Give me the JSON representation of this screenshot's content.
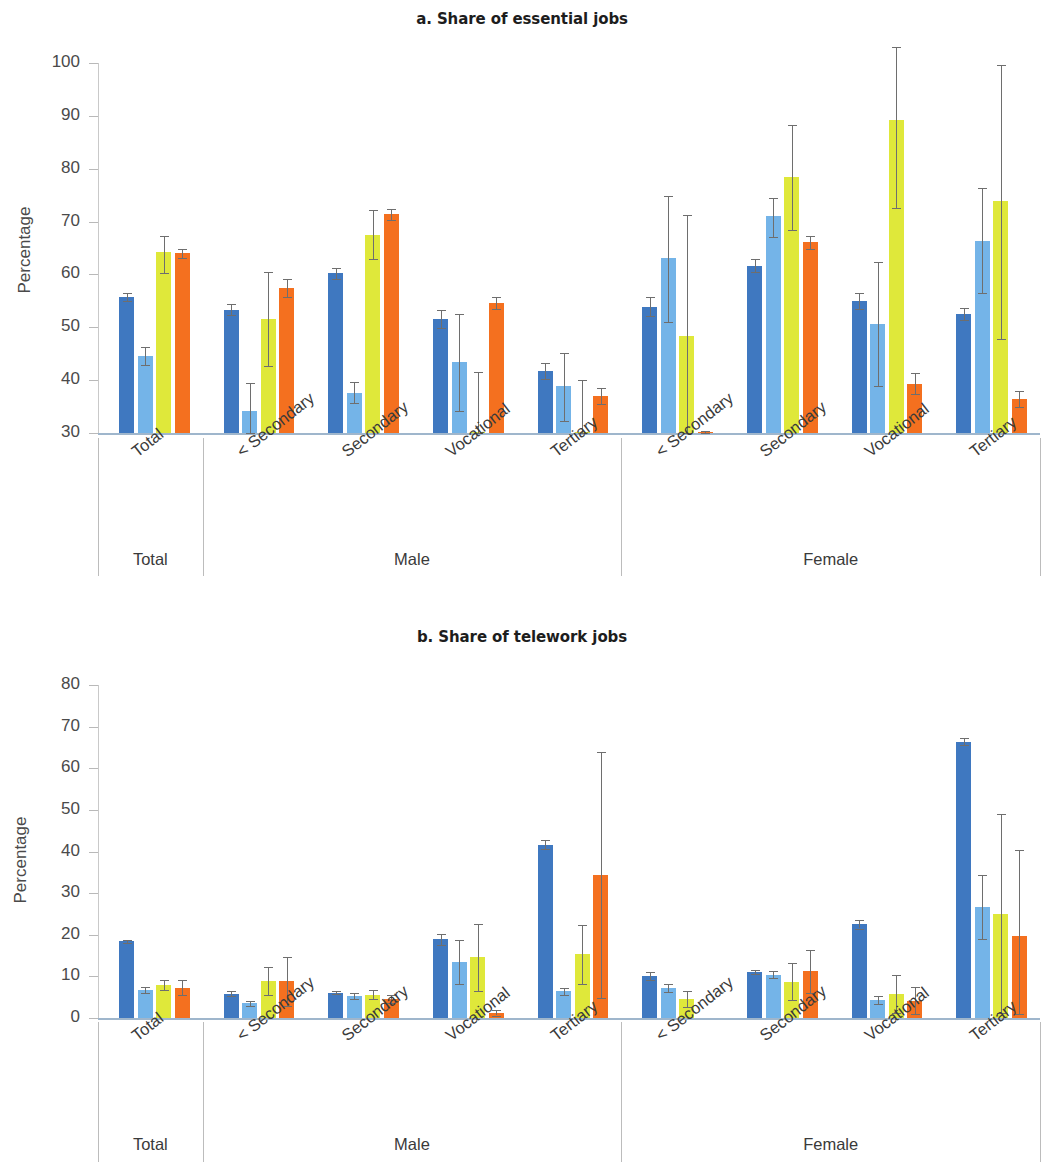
{
  "figure": {
    "y_axis_label": "Percentage"
  },
  "chart_data": [
    {
      "type": "bar",
      "panel": "a",
      "title": "a. Share of essential jobs",
      "xlabel": "",
      "ylabel": "Percentage",
      "ylim": [
        30,
        100
      ],
      "yticks": [
        30,
        40,
        50,
        60,
        70,
        80,
        90,
        100
      ],
      "grid": false,
      "legend": "none",
      "series": [
        {
          "name": "series-1",
          "color": "#3f78c0"
        },
        {
          "name": "series-2",
          "color": "#74b4e8"
        },
        {
          "name": "series-3",
          "color": "#dfe83a"
        },
        {
          "name": "series-4",
          "color": "#f4701f"
        }
      ],
      "supergroups": [
        {
          "label": "Total",
          "categories": [
            "Total"
          ]
        },
        {
          "label": "Male",
          "categories": [
            "< Secondary",
            "Secondary",
            "Vocational",
            "Tertiary"
          ]
        },
        {
          "label": "Female",
          "categories": [
            "< Secondary",
            "Secondary",
            "Vocational",
            "Tertiary"
          ]
        }
      ],
      "categories": [
        "Total",
        "< Secondary",
        "Secondary",
        "Vocational",
        "Tertiary",
        "< Secondary",
        "Secondary",
        "Vocational",
        "Tertiary"
      ],
      "groups": [
        {
          "supergroup": "Total",
          "category": "Total",
          "values": [
            55.8,
            44.6,
            64.2,
            64.0
          ],
          "err_low": [
            55.0,
            42.9,
            60.3,
            63.2
          ],
          "err_high": [
            56.5,
            46.2,
            67.3,
            64.8
          ]
        },
        {
          "supergroup": "Male",
          "category": "< Secondary",
          "values": [
            53.3,
            34.1,
            51.6,
            57.5
          ],
          "err_low": [
            52.3,
            29.3,
            42.6,
            55.8
          ],
          "err_high": [
            54.4,
            39.4,
            60.4,
            59.2
          ]
        },
        {
          "supergroup": "Male",
          "category": "Secondary",
          "values": [
            60.2,
            37.6,
            67.5,
            71.4
          ],
          "err_low": [
            59.2,
            35.7,
            62.9,
            70.3
          ],
          "err_high": [
            61.2,
            39.6,
            72.1,
            72.3
          ]
        },
        {
          "supergroup": "Male",
          "category": "Vocational",
          "values": [
            51.6,
            43.4,
            30.1,
            54.6
          ],
          "err_low": [
            49.8,
            34.1,
            30.0,
            53.5
          ],
          "err_high": [
            53.3,
            52.6,
            41.6,
            55.8
          ]
        },
        {
          "supergroup": "Male",
          "category": "Tertiary",
          "values": [
            41.7,
            38.9,
            30.1,
            37.0
          ],
          "err_low": [
            40.3,
            32.2,
            30.0,
            35.5
          ],
          "err_high": [
            43.2,
            45.2,
            40.0,
            38.6
          ]
        },
        {
          "supergroup": "Female",
          "category": "< Secondary",
          "values": [
            53.9,
            63.1,
            48.4,
            30.2
          ],
          "err_low": [
            52.2,
            51.0,
            30.0,
            30.0
          ],
          "err_high": [
            55.7,
            74.9,
            71.2,
            30.4
          ]
        },
        {
          "supergroup": "Female",
          "category": "Secondary",
          "values": [
            61.6,
            71.0,
            78.4,
            66.1
          ],
          "err_low": [
            60.4,
            67.1,
            68.4,
            64.9
          ],
          "err_high": [
            62.9,
            74.5,
            88.2,
            67.2
          ]
        },
        {
          "supergroup": "Female",
          "category": "Vocational",
          "values": [
            55.0,
            50.6,
            89.2,
            39.3
          ],
          "err_low": [
            53.5,
            38.9,
            72.5,
            37.3
          ],
          "err_high": [
            56.5,
            62.4,
            103.0,
            41.4
          ]
        },
        {
          "supergroup": "Female",
          "category": "Tertiary",
          "values": [
            52.5,
            66.4,
            73.8,
            36.4
          ],
          "err_low": [
            51.4,
            56.5,
            47.8,
            34.9
          ],
          "err_high": [
            53.7,
            76.3,
            99.7,
            38.0
          ]
        }
      ]
    },
    {
      "type": "bar",
      "panel": "b",
      "title": "b. Share of telework jobs",
      "xlabel": "",
      "ylabel": "Percentage",
      "ylim": [
        0,
        80
      ],
      "yticks": [
        0,
        10,
        20,
        30,
        40,
        50,
        60,
        70,
        80
      ],
      "grid": false,
      "legend": "none",
      "series": [
        {
          "name": "series-1",
          "color": "#3f78c0"
        },
        {
          "name": "series-2",
          "color": "#74b4e8"
        },
        {
          "name": "series-3",
          "color": "#dfe83a"
        },
        {
          "name": "series-4",
          "color": "#f4701f"
        }
      ],
      "supergroups": [
        {
          "label": "Total",
          "categories": [
            "Total"
          ]
        },
        {
          "label": "Male",
          "categories": [
            "< Secondary",
            "Secondary",
            "Vocational",
            "Tertiary"
          ]
        },
        {
          "label": "Female",
          "categories": [
            "< Secondary",
            "Secondary",
            "Vocational",
            "Tertiary"
          ]
        }
      ],
      "categories": [
        "Total",
        "< Secondary",
        "Secondary",
        "Vocational",
        "Tertiary",
        "< Secondary",
        "Secondary",
        "Vocational",
        "Tertiary"
      ],
      "groups": [
        {
          "supergroup": "Total",
          "category": "Total",
          "values": [
            18.4,
            6.7,
            7.9,
            7.3
          ],
          "err_low": [
            18.0,
            6.0,
            6.7,
            5.6
          ],
          "err_high": [
            18.8,
            7.4,
            9.2,
            9.1
          ]
        },
        {
          "supergroup": "Male",
          "category": "< Secondary",
          "values": [
            5.8,
            3.6,
            8.8,
            8.8
          ],
          "err_low": [
            5.2,
            3.0,
            5.5,
            2.8
          ],
          "err_high": [
            6.4,
            4.2,
            12.2,
            14.7
          ]
        },
        {
          "supergroup": "Male",
          "category": "Secondary",
          "values": [
            6.1,
            5.3,
            5.6,
            4.5
          ],
          "err_low": [
            5.8,
            4.6,
            4.6,
            3.5
          ],
          "err_high": [
            6.4,
            6.0,
            6.8,
            5.6
          ]
        },
        {
          "supergroup": "Male",
          "category": "Vocational",
          "values": [
            18.9,
            13.4,
            14.6,
            1.2
          ],
          "err_low": [
            17.6,
            8.1,
            6.5,
            0.6
          ],
          "err_high": [
            20.2,
            18.7,
            22.7,
            1.9
          ]
        },
        {
          "supergroup": "Male",
          "category": "Tertiary",
          "values": [
            41.6,
            6.4,
            15.3,
            34.4
          ],
          "err_low": [
            40.6,
            5.6,
            8.2,
            4.8
          ],
          "err_high": [
            42.7,
            7.3,
            22.3,
            63.8
          ]
        },
        {
          "supergroup": "Female",
          "category": "< Secondary",
          "values": [
            10.0,
            7.1,
            4.5,
            0.0
          ],
          "err_low": [
            9.1,
            6.2,
            2.6,
            0.0
          ],
          "err_high": [
            11.0,
            8.1,
            6.4,
            0.0
          ]
        },
        {
          "supergroup": "Female",
          "category": "Secondary",
          "values": [
            11.0,
            10.3,
            8.7,
            11.2
          ],
          "err_low": [
            10.5,
            9.5,
            4.4,
            6.0
          ],
          "err_high": [
            11.5,
            11.2,
            13.1,
            16.4
          ]
        },
        {
          "supergroup": "Female",
          "category": "Vocational",
          "values": [
            22.5,
            4.3,
            5.8,
            4.2
          ],
          "err_low": [
            21.5,
            3.4,
            1.1,
            1.0
          ],
          "err_high": [
            23.5,
            5.3,
            10.4,
            7.4
          ]
        },
        {
          "supergroup": "Female",
          "category": "Tertiary",
          "values": [
            66.4,
            26.6,
            25.1,
            19.6
          ],
          "err_low": [
            65.6,
            18.9,
            1.2,
            0.9
          ],
          "err_high": [
            67.3,
            34.3,
            49.0,
            40.3
          ]
        }
      ]
    }
  ]
}
